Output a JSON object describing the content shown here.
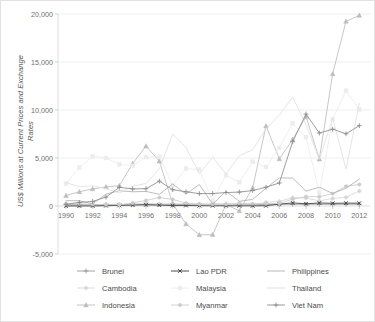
{
  "chart_data": {
    "type": "line",
    "title": "",
    "xlabel": "",
    "ylabel": "US$ Millions at Current Prices and Exchange Rates",
    "xlim": [
      1989.4,
      2012.8
    ],
    "ylim": [
      -5000,
      20000
    ],
    "yticks": [
      -5000,
      0,
      5000,
      10000,
      15000,
      20000
    ],
    "ytick_labels": [
      "-5,000",
      "0",
      "5,000",
      "10,000",
      "15,000",
      "20,000"
    ],
    "xticks": [
      1990,
      1992,
      1994,
      1996,
      1998,
      2000,
      2002,
      2004,
      2006,
      2008,
      2010,
      2012
    ],
    "xtick_labels": [
      "1990",
      "1992",
      "1994",
      "1996",
      "1998",
      "2000",
      "2002",
      "2004",
      "2006",
      "2008",
      "2010",
      "2012"
    ],
    "grid": true,
    "legend_position": "bottom",
    "legend_columns": 3,
    "x": [
      1990,
      1991,
      1992,
      1993,
      1994,
      1995,
      1996,
      1997,
      1998,
      1999,
      2000,
      2001,
      2002,
      2003,
      2004,
      2005,
      2006,
      2007,
      2008,
      2009,
      2010,
      2011,
      2012
    ],
    "series": [
      {
        "name": "Brunei",
        "color": "#9a9a9a",
        "marker": "plus",
        "values": [
          150,
          120,
          130,
          140,
          120,
          190,
          150,
          180,
          150,
          160,
          170,
          180,
          180,
          180,
          150,
          150,
          180,
          180,
          180,
          180,
          180,
          180,
          180
        ]
      },
      {
        "name": "Cambodia",
        "color": "#d7d7d7",
        "marker": "diamond",
        "values": [
          0,
          0,
          30,
          50,
          70,
          150,
          290,
          200,
          240,
          230,
          150,
          150,
          150,
          90,
          130,
          380,
          480,
          870,
          820,
          540,
          780,
          900,
          1560
        ]
      },
      {
        "name": "Indonesia",
        "color": "#bdbdbd",
        "marker": "triangle",
        "values": [
          1090,
          1480,
          1780,
          2000,
          2110,
          4420,
          6240,
          4670,
          250,
          -1870,
          -3000,
          -2980,
          150,
          -500,
          1890,
          8340,
          4910,
          6930,
          9320,
          4880,
          13770,
          19240,
          19850
        ]
      },
      {
        "name": "Lao PDR",
        "color": "#3a3a3a",
        "marker": "cross",
        "values": [
          6,
          7,
          9,
          36,
          59,
          95,
          128,
          86,
          45,
          52,
          34,
          24,
          25,
          20,
          17,
          28,
          187,
          324,
          228,
          319,
          279,
          301,
          294
        ]
      },
      {
        "name": "Malaysia",
        "color": "#ececec",
        "marker": "square",
        "values": [
          2330,
          4000,
          5180,
          5010,
          4340,
          4180,
          5100,
          5140,
          2160,
          3900,
          3790,
          550,
          3200,
          2470,
          4620,
          4060,
          6060,
          8590,
          7170,
          1380,
          9060,
          12000,
          10070
        ]
      },
      {
        "name": "Myanmar",
        "color": "#cccccc",
        "marker": "circle",
        "values": [
          225,
          238,
          172,
          150,
          135,
          318,
          581,
          879,
          684,
          304,
          208,
          192,
          191,
          291,
          251,
          236,
          275,
          715,
          976,
          963,
          1285,
          2058,
          2243
        ]
      },
      {
        "name": "Philippines",
        "color": "#b0b0b0",
        "marker": "none",
        "values": [
          550,
          544,
          228,
          1238,
          1591,
          1478,
          1517,
          1222,
          2287,
          1247,
          2240,
          195,
          1542,
          491,
          688,
          1854,
          2921,
          2916,
          1544,
          1963,
          1298,
          1852,
          2797
        ]
      },
      {
        "name": "Thailand",
        "color": "#e0e0e0",
        "marker": "none",
        "values": [
          2444,
          2014,
          2113,
          1804,
          1366,
          2070,
          2338,
          3882,
          7492,
          6091,
          3350,
          5073,
          3355,
          5235,
          5862,
          8048,
          9460,
          11359,
          8455,
          4854,
          9147,
          3858,
          10705
        ]
      },
      {
        "name": "Viet Nam",
        "color": "#8c8c8c",
        "marker": "plus",
        "values": [
          180,
          375,
          474,
          926,
          1945,
          1780,
          1803,
          2587,
          1700,
          1484,
          1289,
          1300,
          1400,
          1450,
          1610,
          1954,
          2400,
          6700,
          9579,
          7600,
          8000,
          7519,
          8368
        ]
      }
    ]
  },
  "legend": {
    "items": [
      {
        "label": "Brunei"
      },
      {
        "label": "Lao PDR"
      },
      {
        "label": "Philippines"
      },
      {
        "label": "Cambodia"
      },
      {
        "label": "Malaysia"
      },
      {
        "label": "Thailand"
      },
      {
        "label": "Indonesia"
      },
      {
        "label": "Myanmar"
      },
      {
        "label": "Viet Nam"
      }
    ]
  }
}
